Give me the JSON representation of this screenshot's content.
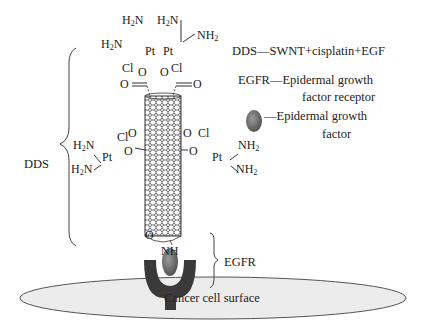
{
  "legend": {
    "dds": "DDS—SWNT+cisplatin+EGF",
    "egfr_line1": "EGFR—Epidermal growth",
    "egfr_line2": "factor receptor",
    "egf_line1": "—Epidermal growth",
    "egf_line2": "factor"
  },
  "labels": {
    "dds_brace": "DDS",
    "egfr_brace": "EGFR",
    "cell_surface": "Cancer cell surface"
  },
  "chemistry": {
    "h2n": "H",
    "h2n_sub": "2",
    "h2n_n": "N",
    "nh2_nh": "NH",
    "nh2_sub": "2",
    "pt": "Pt",
    "cl": "Cl",
    "o": "O",
    "nh": "NH"
  },
  "colors": {
    "receptor": "#3a3a3a",
    "egf": "#6b6b6b",
    "cell": "#ececec",
    "line": "#333333"
  }
}
